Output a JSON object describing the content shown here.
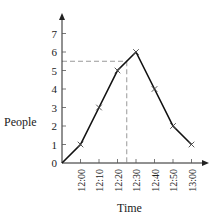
{
  "chart_data": {
    "type": "line",
    "title": "",
    "xlabel": "Time",
    "ylabel": "People",
    "categories": [
      "12:00",
      "12:10",
      "12:20",
      "12:30",
      "12:40",
      "12:50",
      "13:00"
    ],
    "x_ticks": [
      "12:00",
      "12:10",
      "12:20",
      "12:30",
      "12:40",
      "12:50",
      "13:00"
    ],
    "y_ticks": [
      0,
      1,
      2,
      3,
      4,
      5,
      6,
      7
    ],
    "ylim": [
      0,
      7
    ],
    "series": [
      {
        "name": "People",
        "values": [
          1,
          3,
          5,
          6,
          4,
          2,
          1
        ],
        "starts_from_origin": true,
        "marker": "x",
        "color": "#111111"
      }
    ],
    "reference_lines": [
      {
        "type": "horizontal",
        "y": 5.5,
        "style": "dashed",
        "color": "#999999"
      },
      {
        "type": "vertical",
        "x": "12:25",
        "style": "dashed",
        "color": "#999999"
      }
    ],
    "grid": false,
    "legend": null
  }
}
